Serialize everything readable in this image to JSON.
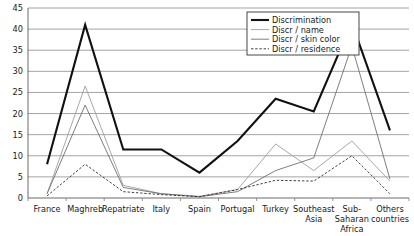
{
  "chart_data": {
    "type": "line",
    "title": "",
    "xlabel": "",
    "ylabel": "",
    "ylim": [
      0,
      45
    ],
    "ytick_step": 5,
    "grid": true,
    "legend_position": "top-right",
    "categories": [
      "France",
      "Maghreb",
      "Repatriate",
      "Italy",
      "Spain",
      "Portugal",
      "Turkey",
      "Southeast Asia",
      "Sub-Saharan Africa",
      "Others countries"
    ],
    "category_lines": [
      [
        "France"
      ],
      [
        "Maghreb"
      ],
      [
        "Repatriate"
      ],
      [
        "Italy"
      ],
      [
        "Spain"
      ],
      [
        "Portugal"
      ],
      [
        "Turkey"
      ],
      [
        "Southeast",
        "Asia"
      ],
      [
        "Sub-",
        "Saharan",
        "Africa"
      ],
      [
        "Others",
        "countries"
      ]
    ],
    "ytick_labels": [
      "0",
      "5",
      "10",
      "15",
      "20",
      "25",
      "30",
      "35",
      "40",
      "45"
    ],
    "series": [
      {
        "name": "Discrimination",
        "style": "thick-solid",
        "color": "#111111",
        "width": 2.1,
        "dash": "",
        "values": [
          8,
          41,
          11.5,
          11.5,
          6,
          13.5,
          23.5,
          20.5,
          41.5,
          16
        ]
      },
      {
        "name": "Discr / name",
        "style": "thin-solid-gray",
        "color": "#9d9d9d",
        "width": 0.9,
        "dash": "",
        "values": [
          1,
          26.5,
          3,
          1,
          0.4,
          2,
          12.8,
          6.5,
          13.5,
          4
        ]
      },
      {
        "name": "Discr / skin color",
        "style": "thin-solid-dark",
        "color": "#6f6f6f",
        "width": 0.9,
        "dash": "",
        "values": [
          1,
          22,
          2.5,
          1,
          0.3,
          1.5,
          6.5,
          9.5,
          36,
          4.5
        ]
      },
      {
        "name": "Discr / residence",
        "style": "dashed",
        "color": "#2b2b2b",
        "width": 0.9,
        "dash": "2.4,1.8",
        "values": [
          0.5,
          8,
          1.5,
          0.8,
          0.3,
          2,
          4.2,
          4,
          10,
          1
        ]
      }
    ]
  }
}
